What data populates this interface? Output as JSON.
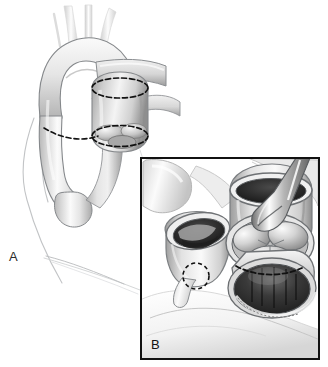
{
  "figure": {
    "background_color": "#ffffff",
    "width": 328,
    "height": 367,
    "style": "grayscale medical line-and-wash illustration"
  },
  "panels": [
    {
      "id": "A",
      "label": "A",
      "caption": "",
      "description": "Anterior view of the thorax showing the ascending aorta, aortic arch with its three brachiocephalic branches, descending aorta, and the pulmonary trunk. Dashed lines mark the planned transection sites.",
      "label_position": {
        "x": 9,
        "y": 250
      },
      "bordered": false
    },
    {
      "id": "B",
      "label": "B",
      "caption": "",
      "description": "Magnified inset after transection: the divided ascending aorta stump with a dashed coronary button outline on the left, the opened pulmonary root displaying three semilunar valve cusps, a dashed annular incision line, and a metal retractor holding the vessel wall.",
      "label_position": {
        "x": 149,
        "y": 336
      },
      "bordered": true,
      "frame": {
        "x": 140,
        "y": 157,
        "width": 180,
        "height": 203,
        "border_color": "#111111",
        "border_width": 2
      }
    }
  ],
  "anatomy": {
    "panel_a": [
      {
        "name": "aortic-arch",
        "label": "Aortic arch"
      },
      {
        "name": "ascending-aorta",
        "label": "Ascending aorta"
      },
      {
        "name": "descending-aorta",
        "label": "Descending aorta"
      },
      {
        "name": "brachiocephalic-trunk",
        "label": "Brachiocephalic trunk"
      },
      {
        "name": "left-common-carotid-artery",
        "label": "Left common carotid artery"
      },
      {
        "name": "left-subclavian-artery",
        "label": "Left subclavian artery"
      },
      {
        "name": "pulmonary-trunk",
        "label": "Pulmonary trunk"
      },
      {
        "name": "right-pulmonary-artery",
        "label": "Right pulmonary artery"
      },
      {
        "name": "chest-wall-contour",
        "label": "Chest wall contour"
      }
    ],
    "panel_b": [
      {
        "name": "transected-aorta-stump",
        "label": "Transected aorta"
      },
      {
        "name": "coronary-button",
        "label": "Coronary artery button"
      },
      {
        "name": "pulmonary-valve-cusps",
        "label": "Semilunar valve cusps"
      },
      {
        "name": "right-ventricular-outflow-tract",
        "label": "Right ventricular outflow tract"
      },
      {
        "name": "surgical-retractor",
        "label": "Retractor"
      },
      {
        "name": "vessel-lumen",
        "label": "Vessel lumen"
      }
    ]
  },
  "markings": {
    "transection_lines": [
      {
        "name": "distal-transection-line",
        "panel": "A",
        "style": "dashed-ellipse"
      },
      {
        "name": "proximal-transection-line",
        "panel": "A",
        "style": "dashed-ellipse"
      },
      {
        "name": "descending-aorta-transection-line",
        "panel": "A",
        "style": "dashed-arc"
      },
      {
        "name": "annular-incision-line",
        "panel": "B",
        "style": "dashed-arc"
      },
      {
        "name": "coronary-button-outline",
        "panel": "B",
        "style": "dashed-circle"
      }
    ],
    "dash_color": "#111111",
    "dash_pattern": "5 3"
  },
  "colors": {
    "background": "#ffffff",
    "outline": "#5e6164",
    "tissue_light": "#f2f2f2",
    "tissue_mid": "#c9c9c9",
    "tissue_dark": "#8d8d8d",
    "lumen_dark": "#2a2a2a",
    "frame": "#111111",
    "label_text": "#2b2b2b",
    "faint_contour": "#c2c4c6"
  }
}
